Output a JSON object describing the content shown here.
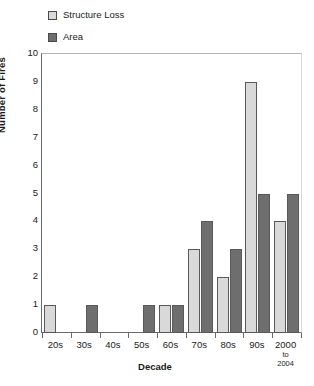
{
  "chart_data": {
    "type": "bar",
    "title": "",
    "xlabel": "Decade",
    "ylabel": "Number of Fires",
    "ylim": [
      0,
      10
    ],
    "ytick_step": 1,
    "yticks": [
      "10",
      "9",
      "8",
      "7",
      "6",
      "5",
      "4",
      "3",
      "2",
      "1",
      "0"
    ],
    "categories": [
      "20s",
      "30s",
      "40s",
      "50s",
      "60s",
      "70s",
      "80s",
      "90s",
      "2000 to 2004"
    ],
    "category_labels": [
      {
        "main": "20s",
        "sub": ""
      },
      {
        "main": "30s",
        "sub": ""
      },
      {
        "main": "40s",
        "sub": ""
      },
      {
        "main": "50s",
        "sub": ""
      },
      {
        "main": "60s",
        "sub": ""
      },
      {
        "main": "70s",
        "sub": ""
      },
      {
        "main": "80s",
        "sub": ""
      },
      {
        "main": "90s",
        "sub": ""
      },
      {
        "main": "2000",
        "sub": "to\n2004"
      }
    ],
    "series": [
      {
        "name": "Structure Loss",
        "color": "#d9d9d9",
        "values": [
          1,
          0,
          0,
          0,
          1,
          3,
          2,
          9,
          4
        ]
      },
      {
        "name": "Area",
        "color": "#6e6e6e",
        "values": [
          0,
          1,
          0,
          1,
          1,
          4,
          3,
          5,
          5
        ]
      }
    ],
    "grid": false,
    "legend_position": "top-left"
  },
  "legend": {
    "items": [
      {
        "label": "Structure Loss",
        "color": "#d9d9d9"
      },
      {
        "label": "Area",
        "color": "#6e6e6e"
      }
    ]
  },
  "axes": {
    "y_title": "Number of Fires",
    "x_title": "Decade"
  }
}
